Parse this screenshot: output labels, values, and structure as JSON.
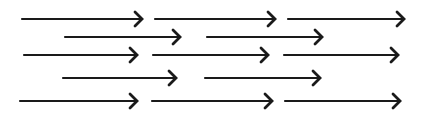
{
  "diagram": {
    "stroke_color": "#1a1a1a",
    "background": "#ffffff",
    "stroke_width": 2.2,
    "head_size": 7,
    "rows": [
      {
        "y": 19,
        "arrows": [
          {
            "x1": 22,
            "x2": 142
          },
          {
            "x1": 155,
            "x2": 275
          },
          {
            "x1": 288,
            "x2": 404
          }
        ]
      },
      {
        "y": 37,
        "arrows": [
          {
            "x1": 65,
            "x2": 180
          },
          {
            "x1": 207,
            "x2": 322
          }
        ]
      },
      {
        "y": 55,
        "arrows": [
          {
            "x1": 24,
            "x2": 137
          },
          {
            "x1": 153,
            "x2": 268
          },
          {
            "x1": 284,
            "x2": 398
          }
        ]
      },
      {
        "y": 78,
        "arrows": [
          {
            "x1": 63,
            "x2": 176
          },
          {
            "x1": 205,
            "x2": 320
          }
        ]
      },
      {
        "y": 101,
        "arrows": [
          {
            "x1": 20,
            "x2": 137
          },
          {
            "x1": 152,
            "x2": 272
          },
          {
            "x1": 285,
            "x2": 400
          }
        ]
      }
    ]
  }
}
